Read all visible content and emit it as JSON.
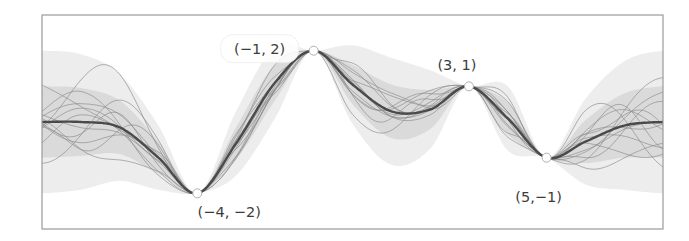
{
  "chart_data": {
    "type": "line",
    "title": "",
    "xlabel": "",
    "ylabel": "",
    "xlim": [
      -8,
      8
    ],
    "ylim": [
      -3,
      3
    ],
    "grid": false,
    "legend": null,
    "observations": [
      {
        "x": -4,
        "y": -2,
        "label": "(−4, −2)",
        "label_pos": "below"
      },
      {
        "x": -1,
        "y": 2,
        "label": "(−1, 2)",
        "label_pos": "upper-left"
      },
      {
        "x": 3,
        "y": 1,
        "label": "(3, 1)",
        "label_pos": "above"
      },
      {
        "x": 5,
        "y": -1,
        "label": "(5,−1)",
        "label_pos": "below"
      }
    ],
    "series": [
      {
        "name": "posterior mean",
        "x": [
          -8,
          -7,
          -6,
          -5,
          -4,
          -3,
          -2,
          -1,
          0,
          1,
          2,
          3,
          4,
          5,
          6,
          7,
          8
        ],
        "values": [
          0,
          0,
          -0.15,
          -1.0,
          -2,
          -0.6,
          1.1,
          2,
          1.05,
          0.3,
          0.35,
          1,
          0.1,
          -1,
          -0.55,
          -0.1,
          0
        ]
      }
    ],
    "uncertainty_band": {
      "x": [
        -8,
        -7,
        -6,
        -5,
        -4,
        -3,
        -2,
        -1,
        0,
        1,
        2,
        3,
        4,
        5,
        6,
        7,
        8
      ],
      "std": [
        1.0,
        0.95,
        0.75,
        0.45,
        0,
        0.45,
        0.5,
        0,
        0.55,
        0.75,
        0.55,
        0,
        0.45,
        0,
        0.6,
        0.9,
        1.0
      ]
    },
    "num_samples": 12,
    "colors": {
      "mean": "#4a4a4a",
      "sample": "#8a8a8a",
      "band": "#c8c8c8",
      "frame": "#9a9a9a"
    }
  }
}
